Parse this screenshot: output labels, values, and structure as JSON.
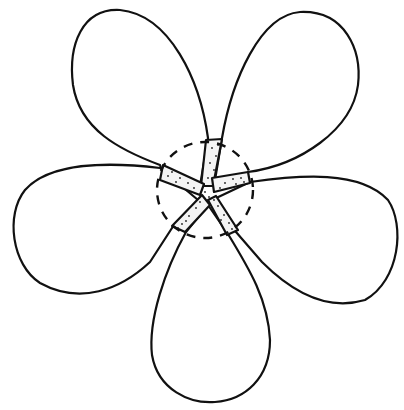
{
  "figure": {
    "petal_count": 5,
    "petals": [
      {
        "name": "upper-left"
      },
      {
        "name": "upper-right"
      },
      {
        "name": "left"
      },
      {
        "name": "right"
      },
      {
        "name": "bottom"
      }
    ],
    "center_marker": "dashed circle",
    "claws": "stippled petal bases",
    "colors": {
      "line": "#111111",
      "background": "#ffffff",
      "stipple": "#222222"
    }
  }
}
